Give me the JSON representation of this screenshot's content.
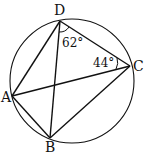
{
  "diagram": {
    "type": "cyclic-quadrilateral",
    "circle": {
      "cx": 72,
      "cy": 81,
      "r": 62
    },
    "points": {
      "A": {
        "x": 12,
        "y": 96,
        "label": "A"
      },
      "B": {
        "x": 50,
        "y": 138,
        "label": "B"
      },
      "C": {
        "x": 130,
        "y": 66,
        "label": "C"
      },
      "D": {
        "x": 60,
        "y": 21,
        "label": "D"
      }
    },
    "angles": [
      {
        "vertex": "D",
        "label": "62°"
      },
      {
        "vertex": "C",
        "label": "44°"
      }
    ],
    "stroke_color": "#111111"
  }
}
